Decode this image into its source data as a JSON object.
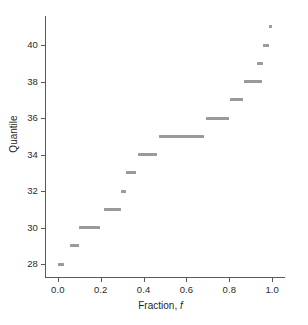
{
  "chart_data": {
    "type": "scatter",
    "title": "",
    "xlabel": "Fraction, f",
    "xlabel_plain": "Fraction,",
    "xlabel_italic": "f",
    "ylabel": "Quantile",
    "xlim": [
      -0.06,
      1.06
    ],
    "ylim": [
      27.3,
      41.6
    ],
    "grid": false,
    "legend": null,
    "xticks": [
      0.0,
      0.2,
      0.4,
      0.6,
      0.8,
      1.0
    ],
    "xticklabels": [
      "0.0",
      "0.2",
      "0.4",
      "0.6",
      "0.8",
      "1.0"
    ],
    "yticks": [
      28,
      30,
      32,
      34,
      36,
      38,
      40
    ],
    "yticklabels": [
      "28",
      "30",
      "32",
      "34",
      "36",
      "38",
      "40"
    ],
    "marker_color": "#9a9a9a",
    "axis_color": "#595959",
    "segments": [
      {
        "quantile": 28,
        "f_start": 0.0,
        "f_end": 0.03
      },
      {
        "quantile": 29,
        "f_start": 0.058,
        "f_end": 0.098
      },
      {
        "quantile": 30,
        "f_start": 0.098,
        "f_end": 0.196
      },
      {
        "quantile": 31,
        "f_start": 0.215,
        "f_end": 0.295
      },
      {
        "quantile": 32,
        "f_start": 0.295,
        "f_end": 0.32
      },
      {
        "quantile": 33,
        "f_start": 0.32,
        "f_end": 0.365
      },
      {
        "quantile": 34,
        "f_start": 0.375,
        "f_end": 0.465
      },
      {
        "quantile": 35,
        "f_start": 0.47,
        "f_end": 0.68
      },
      {
        "quantile": 36,
        "f_start": 0.69,
        "f_end": 0.8
      },
      {
        "quantile": 37,
        "f_start": 0.805,
        "f_end": 0.862
      },
      {
        "quantile": 38,
        "f_start": 0.87,
        "f_end": 0.955
      },
      {
        "quantile": 39,
        "f_start": 0.93,
        "f_end": 0.958
      },
      {
        "quantile": 40,
        "f_start": 0.955,
        "f_end": 0.985
      },
      {
        "quantile": 41,
        "f_start": 0.985,
        "f_end": 0.998
      }
    ]
  }
}
